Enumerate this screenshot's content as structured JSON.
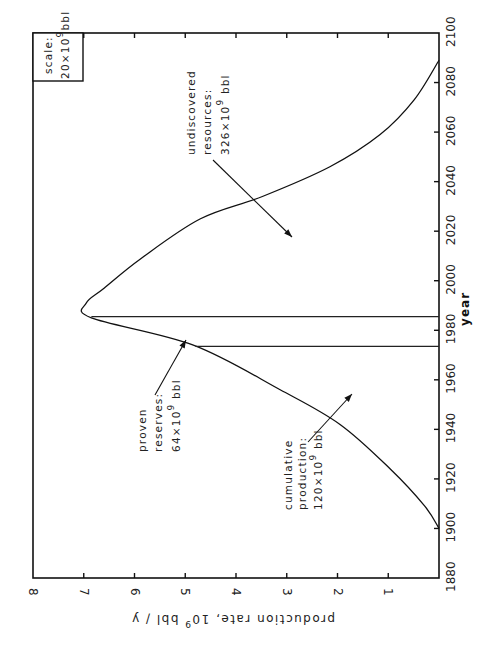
{
  "chart_data": {
    "type": "line",
    "orientation": "rotated-90-ccw",
    "title": "",
    "xlabel": "year",
    "ylabel": "production rate, 10^9 bbl / y",
    "ylabel_parts": {
      "main": "production rate, 10",
      "sup": "9",
      "tail": " bbl / y"
    },
    "xlim": [
      1880,
      2100
    ],
    "ylim": [
      0,
      8
    ],
    "xticks": [
      1880,
      1900,
      1920,
      1940,
      1960,
      1980,
      2000,
      2020,
      2040,
      2060,
      2080,
      2100
    ],
    "yticks": [
      1,
      2,
      3,
      4,
      5,
      6,
      7,
      8
    ],
    "ytick_labels": [
      "1",
      "2",
      "3",
      "4",
      "5",
      "6",
      "7",
      "8"
    ],
    "grid": false,
    "series": [
      {
        "name": "production rate",
        "x": [
          1900,
          1909,
          1924,
          1942,
          1956,
          1974,
          1985,
          1991,
          1997,
          2009,
          2025,
          2034,
          2046,
          2059,
          2073,
          2089
        ],
        "y": [
          0.0,
          0.28,
          0.96,
          1.95,
          3.13,
          4.84,
          6.85,
          6.95,
          6.6,
          5.87,
          4.7,
          3.48,
          2.15,
          1.16,
          0.49,
          0.0
        ]
      }
    ],
    "vertical_lines": [
      {
        "name": "cumulative-boundary",
        "x": 1973.5,
        "y_top": 4.8
      },
      {
        "name": "proven-boundary",
        "x": 1985.5,
        "y_top": 6.85
      }
    ],
    "annotations": [
      {
        "name": "cumulative-production",
        "lines": [
          "cumulative",
          "production:"
        ],
        "value_main": "120×10",
        "value_sup": "9",
        "value_tail": " bbl"
      },
      {
        "name": "proven-reserves",
        "lines": [
          "proven",
          "reserves:"
        ],
        "value_main": "64×10",
        "value_sup": "9",
        "value_tail": " bbl"
      },
      {
        "name": "undiscovered-resources",
        "lines": [
          "undiscovered",
          "resources:"
        ],
        "value_main": "326×10",
        "value_sup": "9",
        "value_tail": " bbl"
      }
    ],
    "scale_box": {
      "line1": "scale:",
      "value_main": "20×10",
      "value_sup": "9",
      "value_tail": "bbl"
    }
  }
}
